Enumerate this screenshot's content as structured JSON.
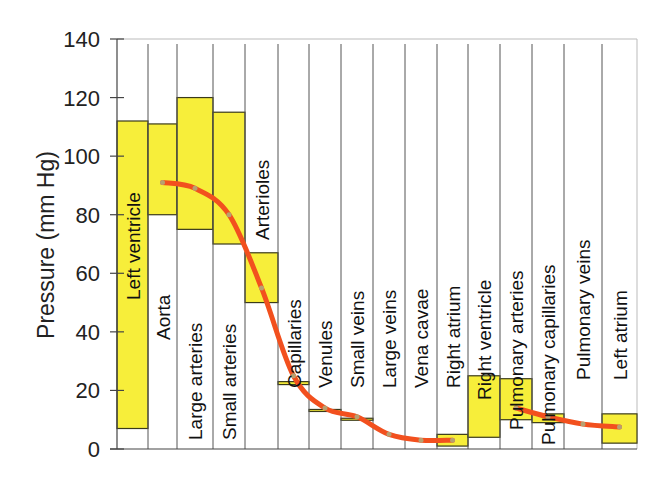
{
  "chart_data": {
    "type": "bar",
    "subtype": "floating-range-with-line",
    "title": "",
    "xlabel": "",
    "ylabel": "Pressure (mm Hg)",
    "ylim": [
      0,
      140
    ],
    "yticks": [
      0,
      20,
      40,
      60,
      80,
      100,
      120,
      140
    ],
    "grid": false,
    "legend": null,
    "categories": [
      "Left ventricle",
      "Aorta",
      "Large arteries",
      "Small arteries",
      "Arterioles",
      "Capillaries",
      "Venules",
      "Small veins",
      "Large veins",
      "Vena cavae",
      "Right atrium",
      "Right ventricle",
      "Pulmonary arteries",
      "Pulmonary capillaries",
      "Pulmonary veins",
      "Left atrium"
    ],
    "series": [
      {
        "name": "Pressure range (min-max)",
        "kind": "range-bar",
        "color": "#f7ee3a",
        "ranges": [
          [
            7,
            112
          ],
          [
            80,
            111
          ],
          [
            75,
            120
          ],
          [
            70,
            115
          ],
          [
            50,
            67
          ],
          [
            22,
            23
          ],
          [
            13,
            13.5
          ],
          [
            10,
            10.5
          ],
          [
            null,
            null
          ],
          [
            null,
            null
          ],
          [
            1,
            5
          ],
          [
            4,
            25
          ],
          [
            10,
            24
          ],
          [
            9,
            12
          ],
          [
            null,
            null
          ],
          [
            2,
            12
          ]
        ]
      },
      {
        "name": "Mean pressure",
        "kind": "line",
        "color": "#f2501e",
        "segments": [
          {
            "categories": [
              "Aorta",
              "Large arteries",
              "Small arteries",
              "Arterioles",
              "Capillaries",
              "Venules",
              "Small veins",
              "Large veins",
              "Vena cavae",
              "Right atrium"
            ],
            "values": [
              91,
              89,
              80,
              55,
              25,
              14,
              11,
              5,
              3,
              3
            ]
          },
          {
            "categories": [
              "Pulmonary arteries",
              "Pulmonary capillaries",
              "Pulmonary veins",
              "Left atrium"
            ],
            "values": [
              14,
              11,
              8.5,
              7.5
            ]
          }
        ]
      }
    ]
  },
  "colors": {
    "bar_fill": "#f7ee3a",
    "bar_stroke": "#3a3a1a",
    "line": "#f2501e",
    "divider": "#555555",
    "axis": "#444444"
  }
}
